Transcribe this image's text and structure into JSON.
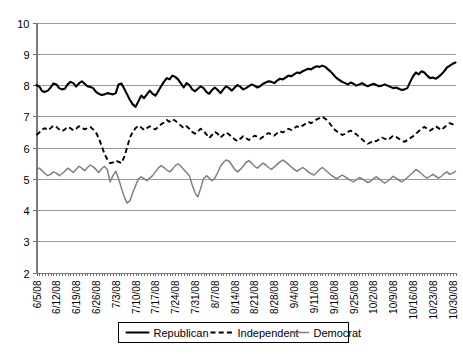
{
  "chart_data": {
    "type": "line",
    "title": "",
    "subtitle": "",
    "xlabel": "",
    "ylabel": "",
    "ylim": [
      2,
      10
    ],
    "ytick_values": [
      2,
      3,
      4,
      5,
      6,
      7,
      8,
      9,
      10
    ],
    "ytick_labels": [
      "2",
      "3",
      "4",
      "5",
      "6",
      "7",
      "8",
      "9",
      "10"
    ],
    "grid": true,
    "grid_axis": "y",
    "legend_position": "bottom",
    "x_axis_type": "date",
    "x_tick_labels": [
      "6/5/08",
      "6/12/08",
      "6/19/08",
      "6/26/08",
      "7/3/08",
      "7/10/08",
      "7/17/08",
      "7/24/08",
      "7/31/08",
      "8/7/08",
      "8/14/08",
      "8/21/08",
      "8/28/08",
      "9/4/08",
      "9/11/08",
      "9/18/08",
      "9/25/08",
      "10/2/08",
      "10/9/08",
      "10/16/08",
      "10/23/08",
      "10/30/08"
    ],
    "x_tick_indices": [
      0,
      7,
      14,
      21,
      28,
      35,
      42,
      49,
      56,
      63,
      70,
      77,
      84,
      91,
      98,
      105,
      112,
      119,
      126,
      133,
      140,
      147
    ],
    "n_points": 149,
    "series": [
      {
        "name": "Republican",
        "color": "#000000",
        "style": "solid",
        "width": 2.1,
        "values": [
          8.0,
          7.95,
          7.8,
          7.78,
          7.82,
          7.92,
          8.05,
          8.02,
          7.9,
          7.86,
          7.88,
          8.02,
          8.1,
          8.06,
          7.95,
          8.05,
          8.12,
          8.04,
          7.96,
          7.94,
          7.9,
          7.78,
          7.72,
          7.68,
          7.7,
          7.74,
          7.72,
          7.7,
          7.74,
          8.02,
          8.05,
          7.88,
          7.7,
          7.52,
          7.38,
          7.3,
          7.48,
          7.66,
          7.58,
          7.7,
          7.82,
          7.72,
          7.66,
          7.8,
          7.96,
          8.1,
          8.22,
          8.18,
          8.3,
          8.26,
          8.18,
          8.05,
          7.92,
          8.06,
          8.0,
          7.86,
          7.8,
          7.88,
          7.96,
          7.9,
          7.78,
          7.72,
          7.84,
          7.92,
          7.84,
          7.74,
          7.86,
          7.96,
          7.9,
          7.82,
          7.92,
          8.0,
          7.94,
          7.86,
          7.9,
          7.96,
          8.02,
          7.98,
          7.92,
          7.96,
          8.04,
          8.08,
          8.12,
          8.1,
          8.06,
          8.14,
          8.2,
          8.18,
          8.24,
          8.3,
          8.28,
          8.34,
          8.4,
          8.38,
          8.44,
          8.48,
          8.52,
          8.5,
          8.56,
          8.6,
          8.58,
          8.62,
          8.58,
          8.5,
          8.42,
          8.32,
          8.22,
          8.16,
          8.1,
          8.06,
          8.02,
          8.08,
          8.04,
          7.98,
          8.02,
          8.06,
          8.0,
          7.96,
          8.0,
          8.04,
          8.0,
          7.96,
          7.98,
          8.02,
          7.98,
          7.94,
          7.9,
          7.92,
          7.88,
          7.84,
          7.86,
          7.9,
          8.1,
          8.28,
          8.4,
          8.34,
          8.44,
          8.4,
          8.3,
          8.22,
          8.24,
          8.2,
          8.26,
          8.34,
          8.44,
          8.56,
          8.62,
          8.68,
          8.72
        ]
      },
      {
        "name": "Independent",
        "color": "#000000",
        "style": "dashed",
        "width": 1.9,
        "values": [
          6.4,
          6.48,
          6.58,
          6.62,
          6.55,
          6.62,
          6.7,
          6.66,
          6.58,
          6.52,
          6.58,
          6.66,
          6.62,
          6.55,
          6.6,
          6.68,
          6.64,
          6.58,
          6.62,
          6.66,
          6.58,
          6.48,
          6.3,
          6.05,
          5.8,
          5.62,
          5.5,
          5.52,
          5.58,
          5.54,
          5.5,
          5.7,
          6.0,
          6.32,
          6.5,
          6.62,
          6.7,
          6.64,
          6.56,
          6.62,
          6.68,
          6.62,
          6.58,
          6.66,
          6.74,
          6.8,
          6.88,
          6.82,
          6.9,
          6.86,
          6.78,
          6.7,
          6.62,
          6.68,
          6.6,
          6.5,
          6.44,
          6.52,
          6.6,
          6.54,
          6.42,
          6.3,
          6.4,
          6.5,
          6.44,
          6.32,
          6.4,
          6.48,
          6.42,
          6.34,
          6.26,
          6.2,
          6.28,
          6.36,
          6.3,
          6.24,
          6.3,
          6.38,
          6.34,
          6.28,
          6.34,
          6.42,
          6.46,
          6.42,
          6.38,
          6.46,
          6.52,
          6.48,
          6.54,
          6.6,
          6.56,
          6.62,
          6.68,
          6.64,
          6.7,
          6.76,
          6.82,
          6.78,
          6.84,
          6.9,
          6.94,
          6.98,
          6.92,
          6.84,
          6.72,
          6.6,
          6.52,
          6.46,
          6.4,
          6.44,
          6.5,
          6.54,
          6.48,
          6.42,
          6.34,
          6.26,
          6.18,
          6.12,
          6.16,
          6.22,
          6.2,
          6.26,
          6.32,
          6.28,
          6.24,
          6.3,
          6.38,
          6.34,
          6.28,
          6.22,
          6.18,
          6.24,
          6.3,
          6.36,
          6.44,
          6.52,
          6.6,
          6.66,
          6.6,
          6.54,
          6.6,
          6.68,
          6.62,
          6.56,
          6.64,
          6.72,
          6.78,
          6.74,
          6.8
        ]
      },
      {
        "name": "Democrat",
        "color": "#808080",
        "style": "solid",
        "width": 1.5,
        "values": [
          5.3,
          5.34,
          5.26,
          5.16,
          5.1,
          5.14,
          5.22,
          5.18,
          5.1,
          5.16,
          5.24,
          5.34,
          5.28,
          5.2,
          5.3,
          5.4,
          5.34,
          5.26,
          5.36,
          5.44,
          5.38,
          5.3,
          5.2,
          5.32,
          5.4,
          5.3,
          4.9,
          5.1,
          5.24,
          5.0,
          4.7,
          4.42,
          4.22,
          4.3,
          4.55,
          4.78,
          5.0,
          5.06,
          5.0,
          4.94,
          5.02,
          5.1,
          5.22,
          5.34,
          5.42,
          5.36,
          5.28,
          5.22,
          5.3,
          5.42,
          5.48,
          5.4,
          5.3,
          5.2,
          5.1,
          4.8,
          4.55,
          4.42,
          4.7,
          5.0,
          5.1,
          5.02,
          4.94,
          5.02,
          5.2,
          5.4,
          5.52,
          5.6,
          5.56,
          5.44,
          5.3,
          5.22,
          5.3,
          5.4,
          5.52,
          5.58,
          5.5,
          5.4,
          5.34,
          5.42,
          5.5,
          5.44,
          5.36,
          5.3,
          5.38,
          5.46,
          5.54,
          5.6,
          5.54,
          5.46,
          5.38,
          5.3,
          5.24,
          5.3,
          5.36,
          5.3,
          5.22,
          5.16,
          5.12,
          5.2,
          5.3,
          5.36,
          5.28,
          5.2,
          5.12,
          5.06,
          5.0,
          5.06,
          5.12,
          5.06,
          5.0,
          4.94,
          4.9,
          4.96,
          5.04,
          5.0,
          4.94,
          4.88,
          4.92,
          5.0,
          5.06,
          5.0,
          4.92,
          4.86,
          4.92,
          5.0,
          5.08,
          5.02,
          4.96,
          4.9,
          4.96,
          5.04,
          5.12,
          5.2,
          5.3,
          5.24,
          5.16,
          5.08,
          5.02,
          5.08,
          5.14,
          5.08,
          5.02,
          5.08,
          5.16,
          5.22,
          5.14,
          5.18,
          5.24
        ]
      }
    ],
    "legend": [
      {
        "label": "Republican",
        "style": "solid",
        "color": "#000000"
      },
      {
        "label": "Independent",
        "style": "dashed",
        "color": "#000000"
      },
      {
        "label": "Democrat",
        "style": "solid",
        "color": "#808080"
      }
    ]
  },
  "colors": {
    "background": "#ffffff",
    "gridline": "#9a9a9a",
    "axis": "#7a7a7a",
    "republican": "#000000",
    "independent": "#000000",
    "democrat": "#808080"
  }
}
